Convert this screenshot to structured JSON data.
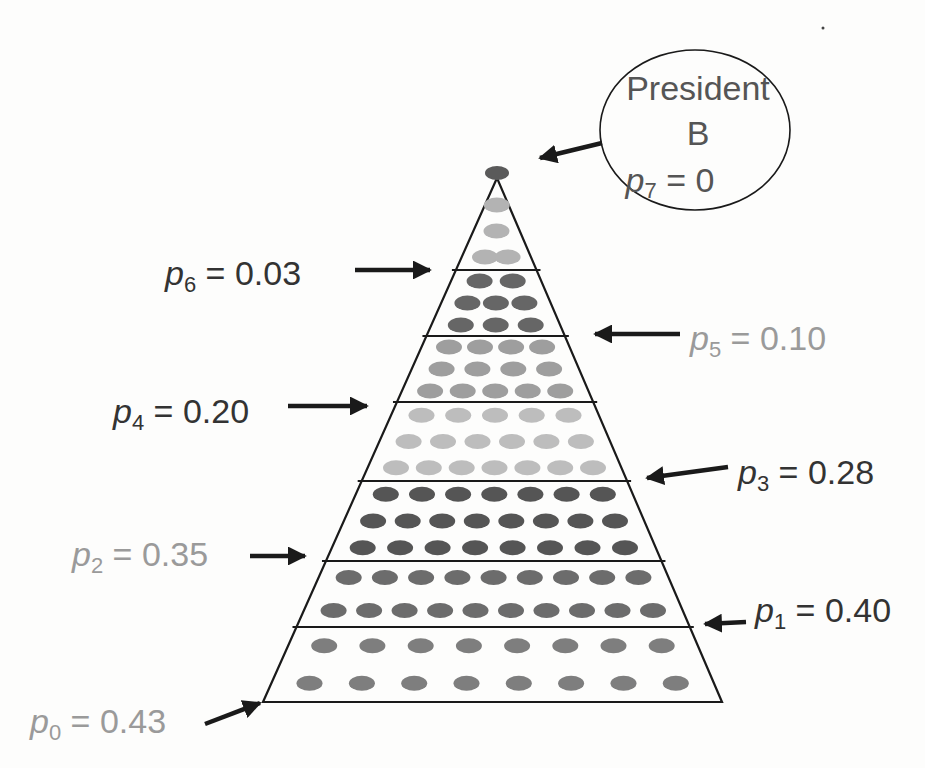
{
  "title_bubble": {
    "line1": "President",
    "line2": "B",
    "var": "p",
    "sub": "7",
    "eq": " = 0"
  },
  "levels": [
    {
      "index": 0,
      "var": "p",
      "sub": "0",
      "value": "0.43",
      "label_side": "left",
      "text_color": "#9a9a9a",
      "dot_color": "#7e7e7e",
      "rows": [
        8,
        8
      ]
    },
    {
      "index": 1,
      "var": "p",
      "sub": "1",
      "value": "0.40",
      "label_side": "right",
      "text_color": "#333333",
      "dot_color": "#6c6c6c",
      "rows": [
        9,
        10
      ]
    },
    {
      "index": 2,
      "var": "p",
      "sub": "2",
      "value": "0.35",
      "label_side": "left",
      "text_color": "#9a9a9a",
      "dot_color": "#555555",
      "rows": [
        7,
        8,
        8
      ]
    },
    {
      "index": 3,
      "var": "p",
      "sub": "3",
      "value": "0.28",
      "label_side": "right",
      "text_color": "#333333",
      "dot_color": "#bdbdbd",
      "rows": [
        5,
        6,
        7
      ]
    },
    {
      "index": 4,
      "var": "p",
      "sub": "4",
      "value": "0.20",
      "label_side": "left",
      "text_color": "#333333",
      "dot_color": "#9e9e9e",
      "rows": [
        4,
        4,
        5
      ]
    },
    {
      "index": 5,
      "var": "p",
      "sub": "5",
      "value": "0.10",
      "label_side": "right",
      "text_color": "#9a9a9a",
      "dot_color": "#666666",
      "rows": [
        2,
        3,
        3
      ]
    },
    {
      "index": 6,
      "var": "p",
      "sub": "6",
      "value": "0.03",
      "label_side": "left",
      "text_color": "#333333",
      "dot_color": "#b3b3b3",
      "rows": [
        1,
        1,
        2
      ]
    }
  ],
  "apex": {
    "dot_color": "#5a5a5a"
  },
  "colors": {
    "line": "#1a1a1a",
    "arrow": "#1a1a1a",
    "background": "#fdfdfc"
  }
}
